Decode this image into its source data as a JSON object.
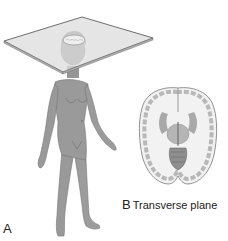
{
  "figure": {
    "panel_a": {
      "letter": "A",
      "subject": "standing human figure",
      "plane": "transverse plane through head"
    },
    "panel_b": {
      "letter": "B",
      "caption": "Transverse plane",
      "subject": "brain cross-section"
    },
    "colors": {
      "background": "#ffffff",
      "skin": "#9a9a9a",
      "skin_shadow": "#7d7d7d",
      "plane_fill": "#dcdcdc",
      "plane_edge": "#6f6f6f",
      "brain_white": "#f2f2f2",
      "brain_gray": "#b8b8b8",
      "text": "#222222"
    }
  }
}
